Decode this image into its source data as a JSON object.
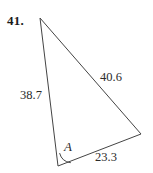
{
  "figure": {
    "problem_number": "41.",
    "type": "triangle-diagram",
    "vertices": {
      "top": {
        "x": 40,
        "y": 18
      },
      "bottom": {
        "x": 58,
        "y": 166
      },
      "right": {
        "x": 141,
        "y": 134
      }
    },
    "labels": {
      "side_left": "38.7",
      "side_right": "40.6",
      "side_bottom": "23.3",
      "angle": "A"
    },
    "colors": {
      "stroke": "#444444",
      "text": "#2b2b2b",
      "number": "#1a1a1a",
      "background": "#ffffff"
    }
  }
}
